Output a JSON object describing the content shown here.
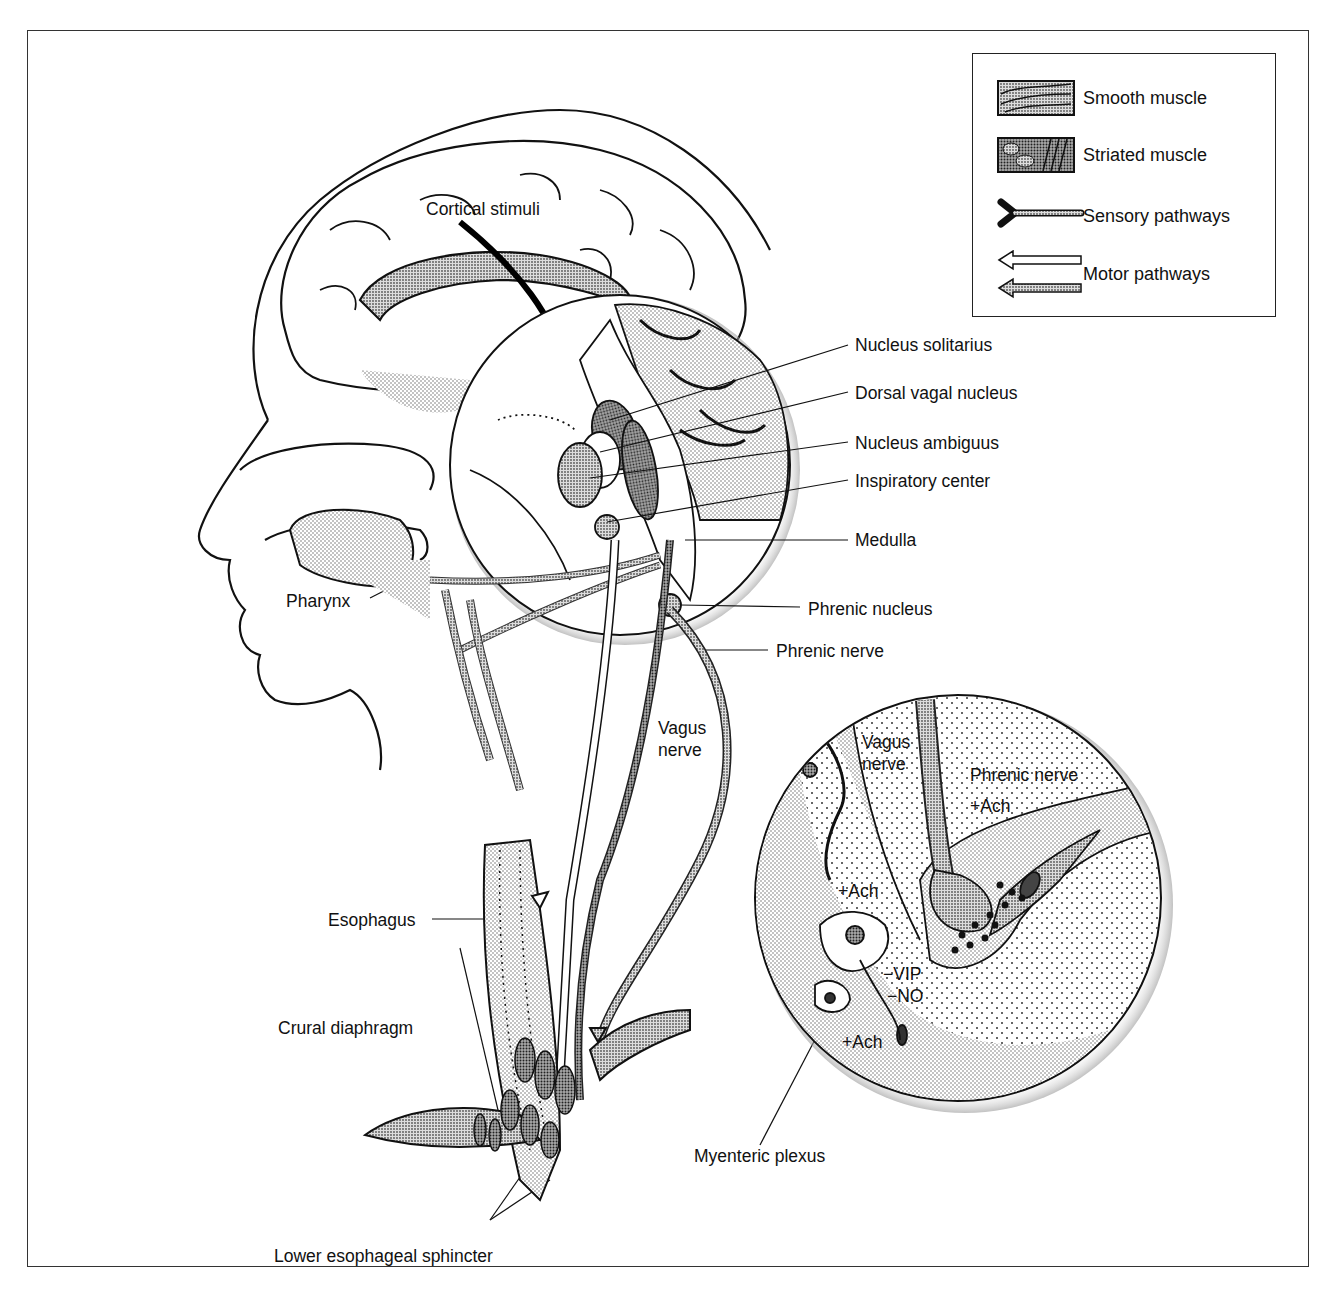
{
  "figure": {
    "colors": {
      "line": "#111111",
      "stipple_light": "#d9d9d9",
      "stipple_mid": "#b8b8b8",
      "stipple_dark": "#8a8a8a",
      "background": "#ffffff"
    }
  },
  "legend": {
    "items": [
      {
        "label": "Smooth muscle",
        "icon": "smooth-muscle-swatch"
      },
      {
        "label": "Striated muscle",
        "icon": "striated-muscle-swatch"
      },
      {
        "label": "Sensory pathways",
        "icon": "sensory-pathway-symbol"
      },
      {
        "label": "Motor pathways",
        "icon": "motor-pathway-arrows"
      }
    ]
  },
  "labels": {
    "cortical_stimuli": "Cortical stimuli",
    "nucleus_solitarius": "Nucleus solitarius",
    "dorsal_vagal_nucleus": "Dorsal vagal nucleus",
    "nucleus_ambiguus": "Nucleus ambiguus",
    "inspiratory_center": "Inspiratory center",
    "medulla": "Medulla",
    "phrenic_nucleus": "Phrenic nucleus",
    "phrenic_nerve": "Phrenic nerve",
    "pharynx": "Pharynx",
    "vagus_nerve_line1": "Vagus",
    "vagus_nerve_line2": "nerve",
    "esophagus": "Esophagus",
    "crural_diaphragm": "Crural diaphragm",
    "lower_esophageal_sphincter": "Lower esophageal sphincter",
    "myenteric_plexus": "Myenteric plexus"
  },
  "inset": {
    "vagus_nerve_line1": "Vagus",
    "vagus_nerve_line2": "nerve",
    "phrenic_nerve": "Phrenic nerve",
    "ach_phrenic": "+Ach",
    "ach_vagal": "+Ach",
    "vip": "−VIP",
    "no": "−NO",
    "ach_lower": "+Ach"
  }
}
